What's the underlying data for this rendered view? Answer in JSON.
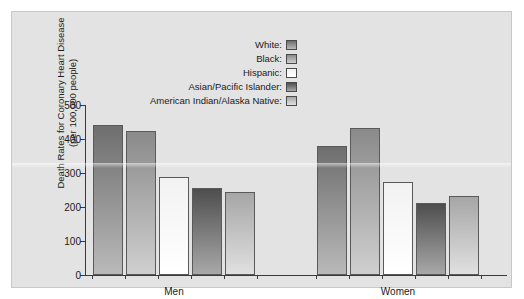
{
  "chart_data": {
    "type": "bar",
    "title": "",
    "xlabel": "",
    "ylabel_line1": "Death Rates for Coronary Heart Disease",
    "ylabel_line2": "(per 100,000 people)",
    "categories": [
      "Men",
      "Women"
    ],
    "ylim": [
      0,
      500
    ],
    "yticks": [
      0,
      100,
      200,
      300,
      400,
      500
    ],
    "ytick_labels": [
      "0",
      "100",
      "200",
      "300",
      "400",
      "500"
    ],
    "grid": false,
    "legend_position": "top-center",
    "series": [
      {
        "name": "White:",
        "swatch_top": "#6e6e6e",
        "swatch_bottom": "#b9b9b9",
        "values": [
          441,
          378
        ]
      },
      {
        "name": "Black:",
        "swatch_top": "#8a8a8a",
        "swatch_bottom": "#cfcfcf",
        "values": [
          424,
          432
        ]
      },
      {
        "name": "Hispanic:",
        "swatch_top": "#f2f2f2",
        "swatch_bottom": "#ffffff",
        "values": [
          287,
          273
        ]
      },
      {
        "name": "Asian/Pacific Islander:",
        "swatch_top": "#4e4e4e",
        "swatch_bottom": "#a8a8a8",
        "values": [
          256,
          213
        ]
      },
      {
        "name": "American Indian/Alaska Native:",
        "swatch_top": "#a6a6a6",
        "swatch_bottom": "#e0e0e0",
        "values": [
          244,
          232
        ]
      }
    ]
  },
  "legend": {
    "items": [
      {
        "label": "White:"
      },
      {
        "label": "Black:"
      },
      {
        "label": "Hispanic:"
      },
      {
        "label": "Asian/Pacific Islander:"
      },
      {
        "label": "American Indian/Alaska Native:"
      }
    ]
  },
  "axes": {
    "y_title_line1": "Death Rates for Coronary Heart Disease",
    "y_title_line2": "(per 100,000 people)",
    "y_ticks": [
      "500",
      "400",
      "300",
      "200",
      "100",
      "0"
    ],
    "x_groups": [
      "Men",
      "Women"
    ]
  },
  "colors": {
    "panel_background": "#e3e3e3",
    "page_background": "#ffffff",
    "axis": "#3a3a3a",
    "text": "#1a1a1a",
    "bar_outline": "#5a5a5a"
  }
}
